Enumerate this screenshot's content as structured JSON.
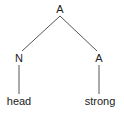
{
  "tree": {
    "root": {
      "label": "A",
      "x": 60,
      "y": 3
    },
    "left": {
      "label": "N",
      "x": 19,
      "y": 52
    },
    "right": {
      "label": "A",
      "x": 99,
      "y": 52
    },
    "left_leaf": {
      "label": "head",
      "x": 19,
      "y": 95
    },
    "right_leaf": {
      "label": "strong",
      "x": 100,
      "y": 95
    }
  },
  "colors": {
    "line": "#555555",
    "text": "#222222"
  }
}
